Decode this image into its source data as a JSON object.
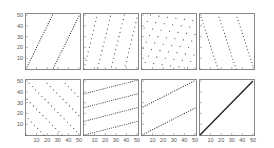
{
  "chart_data": [
    {
      "type": "scatter",
      "panel": 1,
      "title": "",
      "formula": "y = (2*x) mod 51",
      "xlim": [
        0,
        51
      ],
      "ylim": [
        0,
        51
      ],
      "xticks": [],
      "yticks": [
        10,
        20,
        30,
        40,
        50
      ],
      "description": "Two steep parallel lines, slope ~2"
    },
    {
      "type": "scatter",
      "panel": 2,
      "title": "",
      "formula": "y = (4*x) mod 51",
      "xlim": [
        0,
        51
      ],
      "ylim": [
        0,
        51
      ],
      "xticks": [],
      "yticks": [],
      "description": "Four steep parallel lines, slope ~4"
    },
    {
      "type": "scatter",
      "panel": 3,
      "title": "",
      "formula": "y = (19*x) mod 51",
      "xlim": [
        0,
        51
      ],
      "ylim": [
        0,
        51
      ],
      "xticks": [],
      "yticks": [],
      "description": "Scattered lattice of points"
    },
    {
      "type": "scatter",
      "panel": 4,
      "title": "",
      "formula": "y = (-3*x) mod 51",
      "xlim": [
        0,
        51
      ],
      "ylim": [
        0,
        51
      ],
      "xticks": [],
      "yticks": [],
      "description": "Four descending parallel lines"
    },
    {
      "type": "scatter",
      "panel": 5,
      "title": "",
      "formula": "y = (33*x) mod 51",
      "xlim": [
        0,
        51
      ],
      "ylim": [
        0,
        51
      ],
      "xticks": [
        10,
        20,
        30,
        40,
        50
      ],
      "yticks": [
        10,
        20,
        30,
        40,
        50
      ],
      "description": "Scattered lattice of points"
    },
    {
      "type": "scatter",
      "panel": 6,
      "title": "",
      "formula": "y = (13*x) mod 51 (shallow lines)",
      "xlim": [
        0,
        51
      ],
      "ylim": [
        0,
        51
      ],
      "xticks": [
        10,
        20,
        30,
        40,
        50
      ],
      "yticks": [],
      "description": "Four shallow ascending lines, slope ~0.25"
    },
    {
      "type": "scatter",
      "panel": 7,
      "title": "",
      "formula": "y = (26*x) mod 51",
      "xlim": [
        0,
        51
      ],
      "ylim": [
        0,
        51
      ],
      "xticks": [
        10,
        20,
        30,
        40,
        50
      ],
      "yticks": [],
      "description": "Two ascending lines, slope ~0.5"
    },
    {
      "type": "scatter",
      "panel": 8,
      "title": "",
      "formula": "y = x",
      "xlim": [
        0,
        51
      ],
      "ylim": [
        0,
        51
      ],
      "xticks": [
        10,
        20,
        30,
        40,
        50
      ],
      "yticks": [],
      "description": "Single diagonal line y=x"
    }
  ],
  "layout": {
    "cols": [
      25,
      83,
      141,
      199
    ],
    "rows": [
      13,
      79
    ],
    "panel_w": 56,
    "panel_h": 57,
    "n": 51,
    "multipliers": [
      2,
      4,
      19,
      48,
      33,
      "shallow",
      26,
      1
    ]
  },
  "colors": {
    "axis": "#888888",
    "marker": "#333333",
    "label": "#555555",
    "line8": "#222222"
  }
}
